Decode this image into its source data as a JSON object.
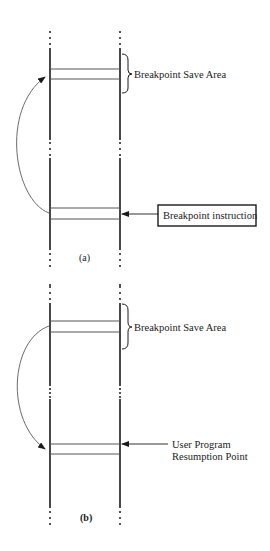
{
  "diagram": {
    "panels": [
      {
        "id": "a",
        "caption": "(a)",
        "save_area_label": "Breakpoint Save Area",
        "pointer_label": "Breakpoint instruction",
        "pointer_boxed": true,
        "curve_direction": "from breakpoint instruction up to save area"
      },
      {
        "id": "b",
        "caption": "(b)",
        "save_area_label": "Breakpoint Save Area",
        "pointer_label_line1": "User Program",
        "pointer_label_line2": "Resumption Point",
        "pointer_boxed": false,
        "curve_direction": "from save area down to resumption point"
      }
    ],
    "colors": {
      "line": "#1a1a1a",
      "thin_line": "#555555",
      "background": "#ffffff"
    }
  }
}
